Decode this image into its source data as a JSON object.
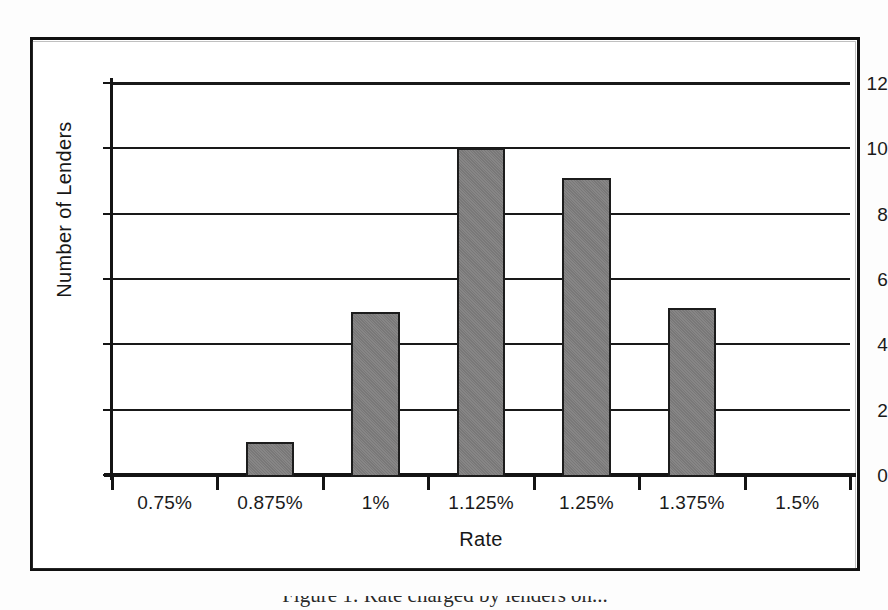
{
  "figure": {
    "caption": "Figure 1:  Rate charged by lenders on...",
    "frame_color": "#111111",
    "bar_color": "#807f7f",
    "bar_edge_color": "#1c1c1c",
    "grid_color": "#191919"
  },
  "chart_data": {
    "type": "bar",
    "title": "",
    "xlabel": "Rate",
    "ylabel": "Number of Lenders",
    "categories": [
      "0.75%",
      "0.875%",
      "1%",
      "1.125%",
      "1.25%",
      "1.375%",
      "1.5%"
    ],
    "values": [
      0,
      1,
      5,
      10,
      9.1,
      5.1,
      0
    ],
    "ylim": [
      0,
      12
    ],
    "yticks": [
      0,
      2,
      4,
      6,
      8,
      10,
      12
    ],
    "ytick_labels": [
      "0",
      "2",
      "4",
      "6",
      "8",
      "10",
      "12"
    ],
    "grid": "horizontal",
    "legend": "none",
    "bars_between_ticks": true,
    "bar_width_fraction": 0.46
  }
}
